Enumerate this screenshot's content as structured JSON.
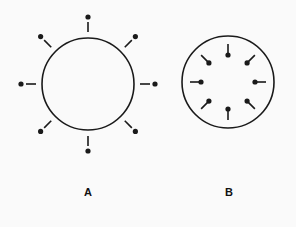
{
  "diagram": {
    "stroke_color": "#1a1a1a",
    "background": "#fafafa",
    "figures": [
      {
        "id": "A",
        "label": "A",
        "cx": 88,
        "cy": 84,
        "r": 46,
        "pin_orientation": "outward",
        "pin_count": 8,
        "pin_line_inner": 52,
        "pin_line_outer": 62,
        "pin_dot_radius": 67,
        "label_x": 88,
        "label_y": 186
      },
      {
        "id": "B",
        "label": "B",
        "cx": 228,
        "cy": 82,
        "r": 46,
        "pin_orientation": "inward",
        "pin_count": 8,
        "pin_line_inner": 27,
        "pin_line_outer": 38,
        "pin_dot_radius": 27,
        "label_x": 229,
        "label_y": 186
      }
    ]
  }
}
